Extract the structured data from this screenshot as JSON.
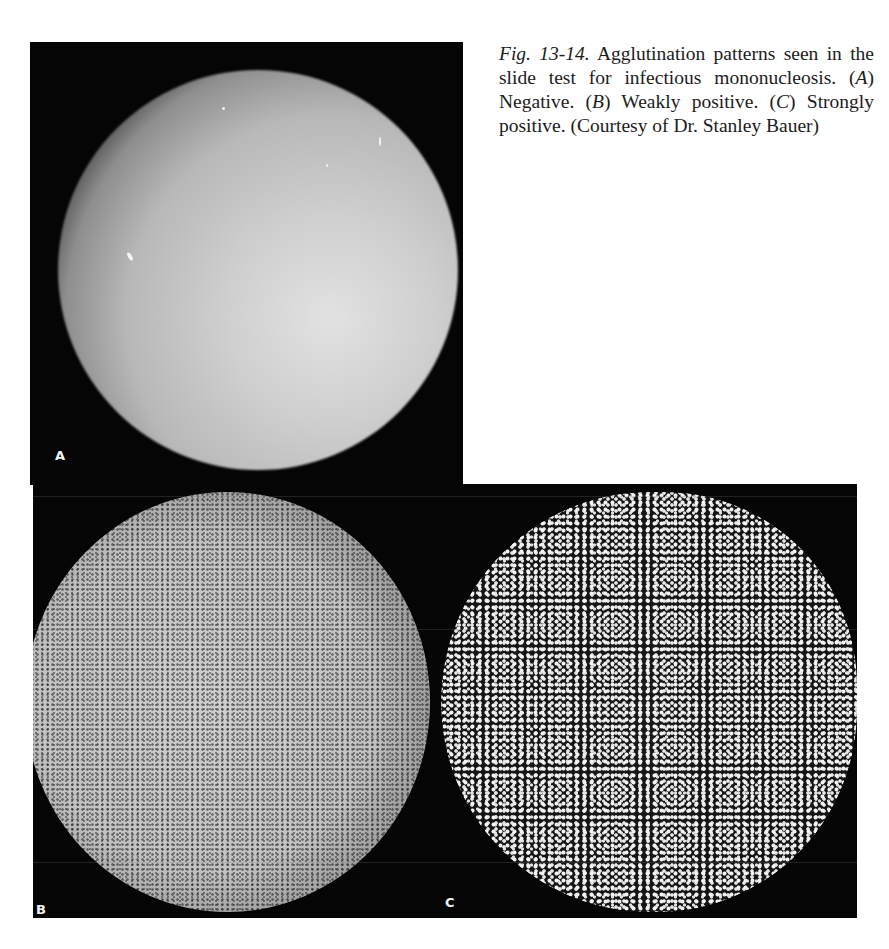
{
  "figure": {
    "number_label": "Fig. 13-14.",
    "caption_lines": [
      "Agglutination patterns seen in the slide test for infectious mononucleosis.",
      "(A) Negative.",
      "(B) Weakly positive.",
      "(C) Strongly positive.",
      "(Courtesy of Dr. Stanley Bauer)"
    ],
    "caption": {
      "lead": "Agglutination patterns seen in the slide test for infectious mononucleosis.",
      "a_letter": "A",
      "a_text": "Negative.",
      "b_letter": "B",
      "b_text": "Weakly positive.",
      "c_letter": "C",
      "c_text": "Strongly positive.",
      "credit": "(Courtesy of Dr. Stanley Bauer)"
    }
  },
  "panels": [
    {
      "label": "A",
      "description": "Negative – smooth, homogeneous suspension"
    },
    {
      "label": "B",
      "description": "Weakly positive – fine granular agglutination"
    },
    {
      "label": "C",
      "description": "Strongly positive – coarse clumped agglutination"
    }
  ]
}
